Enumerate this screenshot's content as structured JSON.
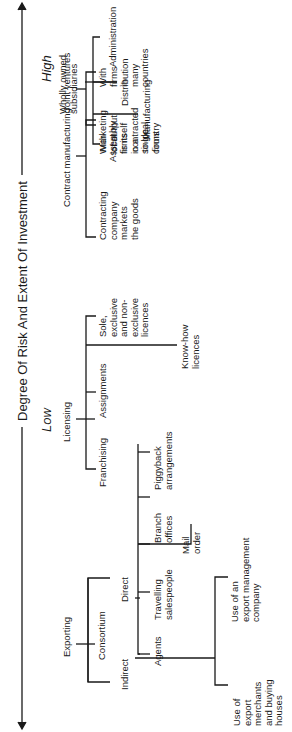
{
  "axis": {
    "title": "Degree Of Risk And Extent Of Investment",
    "low_label": "Low",
    "high_label": "High"
  },
  "modes": {
    "exporting": {
      "label": "Exporting",
      "consortium": "Consortium",
      "indirect": {
        "label": "Indirect",
        "children": [
          "Use of\nexport\nmerchants\nand buying\nhouses",
          "Use of an\nexport management\ncompany"
        ]
      },
      "direct": {
        "label": "Direct",
        "children": [
          "Agents",
          "Travelling\nsalespeople",
          "Mail\norder",
          "Branch\noffices",
          "Piggyback\narrangements"
        ]
      }
    },
    "licensing": {
      "label": "Licensing",
      "children": [
        "Franchising",
        "Assignments",
        "Know-how\nlicences",
        "Sole,\nexclusive\nand non-\nexclusive\nlicences"
      ]
    },
    "contract_manufacturing": {
      "label": "Contract manufacturing",
      "children": [
        "Contracting\ncompany\nmarkets\nthe goods",
        "Marketing\nof output\nis itself\ncontracted\nto local\nfirms"
      ]
    },
    "joint_ventures": {
      "label": "Joint ventures",
      "children": [
        "With\nlocal\nfirms\nin a\nsingle\ncountry",
        "With\nfirms\nin\nmany\ncountries"
      ]
    },
    "wholly_owned": {
      "label": "Wholly owned\nsubsidiaries",
      "children": [
        "Assembly",
        "Manufacturing",
        "Distribution",
        "Administration"
      ]
    }
  }
}
